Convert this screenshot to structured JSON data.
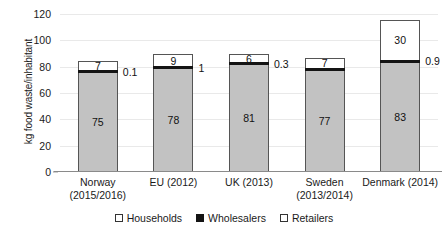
{
  "chart_data": {
    "type": "bar",
    "stacked": true,
    "title": "",
    "subtitle": "",
    "xlabel": "",
    "ylabel": "kg food waste/inhabitant",
    "ylim": [
      0,
      120
    ],
    "yticks": [
      0,
      20,
      40,
      60,
      80,
      100,
      120
    ],
    "ytick_labels": [
      "0",
      "20",
      "40",
      "60",
      "80",
      "100",
      "120"
    ],
    "grid": true,
    "legend_position": "bottom-center",
    "categories": [
      "Norway (2015/2016)",
      "EU (2012)",
      "UK (2013)",
      "Sweden (2013/2014)",
      "Denmark (2014)"
    ],
    "category_lines": [
      [
        "Norway",
        "(2015/2016)"
      ],
      [
        "EU (2012)",
        ""
      ],
      [
        "UK (2013)",
        ""
      ],
      [
        "Sweden",
        "(2013/2014)"
      ],
      [
        "Denmark (2014)",
        ""
      ]
    ],
    "series": [
      {
        "name": "Households",
        "color": "#c2c2c2",
        "values": [
          75,
          78,
          81,
          77,
          83
        ],
        "labels": [
          "75",
          "78",
          "81",
          "77",
          "83"
        ]
      },
      {
        "name": "Wholesalers",
        "color": "#141414",
        "values": [
          0.1,
          1,
          0.3,
          0.2,
          0.9
        ],
        "labels": [
          "0.1",
          "1",
          "0.3",
          "",
          "0.9"
        ]
      },
      {
        "name": "Retailers",
        "color": "#ffffff",
        "values": [
          7,
          9,
          6,
          7,
          30
        ],
        "labels": [
          "7",
          "9",
          "6",
          "7",
          "30"
        ]
      }
    ],
    "totals": [
      82.1,
      88,
      87.3,
      84.2,
      113.9
    ]
  },
  "legend": {
    "items": [
      {
        "label": "Households",
        "marker": "open-square"
      },
      {
        "label": "Wholesalers",
        "marker": "filled-square"
      },
      {
        "label": "Retailers",
        "marker": "open-square"
      }
    ]
  },
  "colors": {
    "households": "#c2c2c2",
    "wholesalers": "#141414",
    "retailers": "#ffffff",
    "axis": "#8a8a8a",
    "grid": "#e9e9e9",
    "text": "#1a1a1a"
  }
}
